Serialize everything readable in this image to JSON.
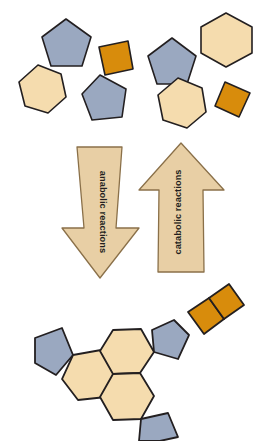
{
  "figure": {
    "background_color": "#ffffff"
  },
  "palette": {
    "hexagon_fill": "#f5dcae",
    "pentagon_fill": "#9aa8c0",
    "square_fill": "#d88c0c",
    "arrow_fill": "#e8cfa5",
    "outline": "#231f20",
    "label_color": "#231f20"
  },
  "arrows": {
    "left": {
      "label": "anabolic reactions",
      "direction": "down",
      "fill": "#e8cfa5"
    },
    "right": {
      "label": "catabolic reactions",
      "direction": "up",
      "fill": "#e8cfa5"
    }
  },
  "monomers": {
    "caption": "free monomer subunits",
    "count": 9,
    "items": [
      {
        "name": "pentagon-1",
        "shape": "pentagon",
        "fill": "#9aa8c0"
      },
      {
        "name": "square-1",
        "shape": "square",
        "fill": "#d88c0c"
      },
      {
        "name": "pentagon-2",
        "shape": "pentagon",
        "fill": "#9aa8c0"
      },
      {
        "name": "hexagon-1",
        "shape": "hexagon",
        "fill": "#f5dcae"
      },
      {
        "name": "hexagon-2",
        "shape": "hexagon",
        "fill": "#f5dcae"
      },
      {
        "name": "pentagon-3",
        "shape": "pentagon",
        "fill": "#9aa8c0"
      },
      {
        "name": "hexagon-3",
        "shape": "hexagon",
        "fill": "#f5dcae"
      },
      {
        "name": "square-2",
        "shape": "square",
        "fill": "#d88c0c"
      },
      {
        "name": "hexagon-4",
        "shape": "hexagon",
        "fill": "#f5dcae"
      }
    ]
  },
  "polymer": {
    "caption": "assembled macromolecule",
    "count": 8,
    "items": [
      {
        "name": "polymer-pentagon-left",
        "shape": "pentagon",
        "fill": "#9aa8c0"
      },
      {
        "name": "polymer-hexagon-left",
        "shape": "hexagon",
        "fill": "#f5dcae"
      },
      {
        "name": "polymer-hexagon-center",
        "shape": "hexagon",
        "fill": "#f5dcae"
      },
      {
        "name": "polymer-hexagon-lower",
        "shape": "hexagon",
        "fill": "#f5dcae"
      },
      {
        "name": "polymer-pentagon-lower",
        "shape": "pentagon",
        "fill": "#9aa8c0"
      },
      {
        "name": "polymer-pentagon-right",
        "shape": "pentagon",
        "fill": "#9aa8c0"
      },
      {
        "name": "polymer-square-1",
        "shape": "square",
        "fill": "#d88c0c"
      },
      {
        "name": "polymer-square-2",
        "shape": "square",
        "fill": "#d88c0c"
      }
    ]
  }
}
